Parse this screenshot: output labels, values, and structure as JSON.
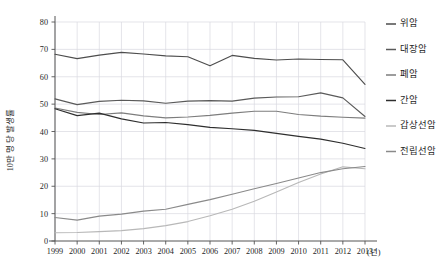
{
  "chart_data": {
    "type": "line",
    "title": "",
    "xlabel": "(년)",
    "ylabel": "10만 명 당 발생률",
    "x": [
      1999,
      2000,
      2001,
      2002,
      2003,
      2004,
      2005,
      2006,
      2007,
      2008,
      2009,
      2010,
      2011,
      2012,
      2013
    ],
    "xtick_labels": [
      "1999",
      "2000",
      "2001",
      "2002",
      "2003",
      "2004",
      "2005",
      "2006",
      "2007",
      "2008",
      "2009",
      "2010",
      "2011",
      "2012",
      "2013"
    ],
    "ytick_labels": [
      "0",
      "10",
      "20",
      "30",
      "40",
      "50",
      "60",
      "70",
      "80"
    ],
    "ytick_values": [
      0,
      10,
      20,
      30,
      40,
      50,
      60,
      70,
      80
    ],
    "ylim": [
      0,
      80
    ],
    "xlim": [
      1999,
      2013
    ],
    "grid": true,
    "legend_position": "right",
    "series": [
      {
        "name": "위암",
        "color": "#4d4d4d",
        "values": [
          68.2,
          66.6,
          67.9,
          68.9,
          68.3,
          67.6,
          67.3,
          64.0,
          67.8,
          66.7,
          66.1,
          66.5,
          66.3,
          66.2,
          57.2
        ]
      },
      {
        "name": "대장암",
        "color": "#5a5a5a",
        "values": [
          51.9,
          49.8,
          51.0,
          51.4,
          51.2,
          50.3,
          51.1,
          51.3,
          51.1,
          52.2,
          52.6,
          52.7,
          54.1,
          52.3,
          45.5
        ]
      },
      {
        "name": "폐암",
        "color": "#7d7d7d",
        "values": [
          48.6,
          47.0,
          46.2,
          46.8,
          45.7,
          45.0,
          45.3,
          45.9,
          46.7,
          47.4,
          47.4,
          46.2,
          45.6,
          45.2,
          44.9
        ]
      },
      {
        "name": "간암",
        "color": "#2e2e2e",
        "values": [
          48.3,
          45.8,
          46.7,
          44.6,
          43.1,
          43.3,
          42.5,
          41.5,
          41.0,
          40.4,
          39.3,
          38.2,
          37.2,
          35.7,
          33.8
        ]
      },
      {
        "name": "갑상선암",
        "color": "#b8b8b8",
        "values": [
          3.0,
          3.1,
          3.4,
          3.8,
          4.5,
          5.6,
          7.1,
          9.2,
          11.6,
          14.5,
          17.9,
          21.4,
          24.5,
          27.1,
          26.4
        ]
      },
      {
        "name": "전립선암",
        "color": "#8a8a8a",
        "values": [
          8.6,
          7.6,
          9.1,
          9.8,
          10.9,
          11.6,
          13.4,
          15.1,
          17.1,
          19.1,
          21.0,
          23.0,
          25.0,
          26.4,
          27.2
        ]
      }
    ]
  },
  "legend": {
    "items": [
      {
        "label": "위암",
        "color": "#4d4d4d"
      },
      {
        "label": "대장암",
        "color": "#5a5a5a"
      },
      {
        "label": "폐암",
        "color": "#7d7d7d"
      },
      {
        "label": "간암",
        "color": "#2e2e2e"
      },
      {
        "label": "갑상선암",
        "color": "#b8b8b8"
      },
      {
        "label": "전립선암",
        "color": "#8a8a8a"
      }
    ]
  }
}
